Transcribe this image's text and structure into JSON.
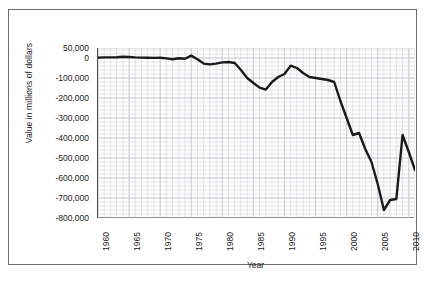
{
  "chart_data": {
    "type": "line",
    "title": "",
    "xlabel": "Year",
    "ylabel": "Value in millions of dollars",
    "xlim": [
      1960,
      2011
    ],
    "ylim": [
      -800000,
      50000
    ],
    "grid": true,
    "legend": false,
    "y_ticks": [
      50000,
      0,
      -100000,
      -200000,
      -300000,
      -400000,
      -500000,
      -600000,
      -700000,
      -800000
    ],
    "y_tick_labels": [
      "50,000",
      "0",
      "-100,000",
      "-200,000",
      "-300,000",
      "-400,000",
      "-500,000",
      "-600,000",
      "-700,000",
      "-800,000"
    ],
    "x_ticks": [
      1960,
      1965,
      1970,
      1975,
      1980,
      1985,
      1990,
      1995,
      2000,
      2005,
      2010
    ],
    "x_tick_labels": [
      "1960",
      "1965",
      "1970",
      "1975",
      "1980",
      "1985",
      "1990",
      "1995",
      "2000",
      "2005",
      "2010"
    ],
    "x_minor_step": 1,
    "y_minor_step": 20000,
    "line_color": "#1a1a1a",
    "line_width": 2.4,
    "grid_color": "#c8c8cf",
    "axis_color": "#4a4a4a",
    "series": [
      {
        "name": "Balance",
        "x": [
          1960,
          1961,
          1962,
          1963,
          1964,
          1965,
          1966,
          1967,
          1968,
          1969,
          1970,
          1971,
          1972,
          1973,
          1974,
          1975,
          1976,
          1977,
          1978,
          1979,
          1980,
          1981,
          1982,
          1983,
          1984,
          1985,
          1986,
          1987,
          1988,
          1989,
          1990,
          1991,
          1992,
          1993,
          1994,
          1995,
          1996,
          1997,
          1998,
          1999,
          2000,
          2001,
          2002,
          2003,
          2004,
          2005,
          2006,
          2007,
          2008,
          2009,
          2010,
          2011
        ],
        "values": [
          2000,
          3000,
          3000,
          4000,
          6000,
          5000,
          3000,
          2000,
          1000,
          500,
          1000,
          -2000,
          -6000,
          -1000,
          -4000,
          12000,
          -6000,
          -28000,
          -32000,
          -28000,
          -22000,
          -20000,
          -25000,
          -60000,
          -100000,
          -125000,
          -148000,
          -158000,
          -120000,
          -95000,
          -80000,
          -38000,
          -50000,
          -75000,
          -95000,
          -100000,
          -105000,
          -110000,
          -120000,
          -215000,
          -300000,
          -385000,
          -375000,
          -455000,
          -520000,
          -630000,
          -760000,
          -710000,
          -705000,
          -385000,
          -470000,
          -560000
        ]
      }
    ]
  }
}
